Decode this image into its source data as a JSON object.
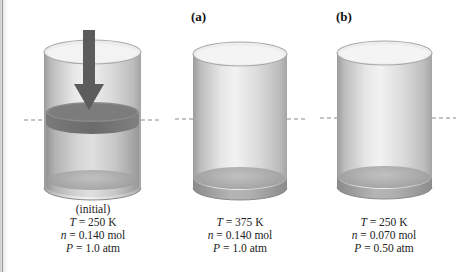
{
  "figure": {
    "reference_line": {
      "style": "dashed",
      "color": "#8a8a8a"
    },
    "arrow": {
      "icon": "down-arrow-icon",
      "color": "#5c5c5c"
    },
    "panels": [
      {
        "id": "initial",
        "label": "",
        "caption_title": "(initial)",
        "T_symbol": "T",
        "T_value": "= 250 K",
        "n_symbol": "n",
        "n_value": "= 0.140 mol",
        "P_symbol": "P",
        "P_value": "= 1.0 atm",
        "has_piston": true,
        "has_arrow": true
      },
      {
        "id": "a",
        "label": "(a)",
        "caption_title": "",
        "T_symbol": "T",
        "T_value": "= 375 K",
        "n_symbol": "n",
        "n_value": "= 0.140 mol",
        "P_symbol": "P",
        "P_value": "= 1.0 atm",
        "has_piston": false,
        "has_arrow": false
      },
      {
        "id": "b",
        "label": "(b)",
        "caption_title": "",
        "T_symbol": "T",
        "T_value": "= 250 K",
        "n_symbol": "n",
        "n_value": "= 0.070 mol",
        "P_symbol": "P",
        "P_value": "= 0.50 atm",
        "has_piston": false,
        "has_arrow": false
      }
    ]
  }
}
